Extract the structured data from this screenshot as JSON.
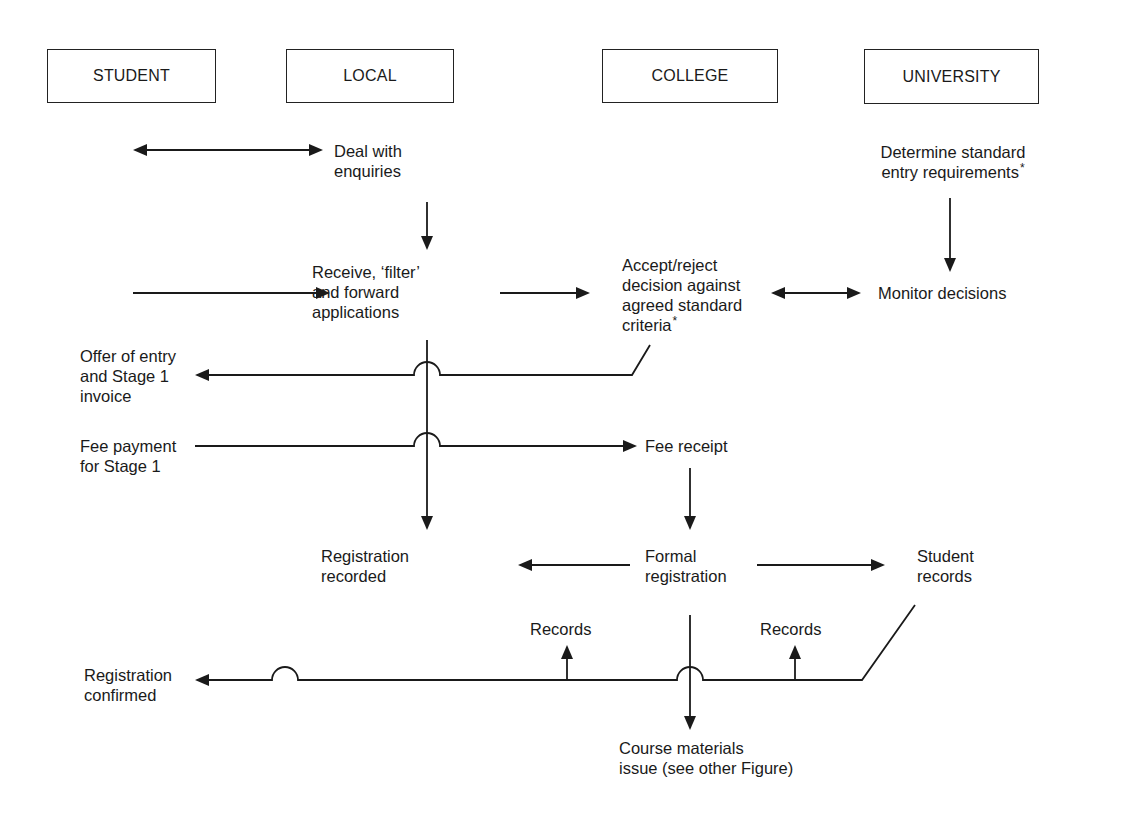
{
  "columns": {
    "student": "STUDENT",
    "local": "LOCAL",
    "college": "COLLEGE",
    "university": "UNIVERSITY"
  },
  "nodes": {
    "deal_enquiries": [
      "Deal with",
      "enquiries"
    ],
    "determine_requirements": [
      "Determine standard",
      "entry requirements"
    ],
    "determine_requirements_mark": "*",
    "receive_filter": [
      "Receive, ‘filter’",
      "and forward",
      "applications"
    ],
    "accept_reject": [
      "Accept/reject",
      "decision against",
      "agreed standard",
      "criteria"
    ],
    "accept_reject_mark": "*",
    "monitor_decisions": "Monitor decisions",
    "offer_entry": [
      "Offer of entry",
      "and Stage 1",
      "invoice"
    ],
    "fee_payment": [
      "Fee payment",
      "for Stage 1"
    ],
    "fee_receipt": "Fee receipt",
    "registration_recorded": [
      "Registration",
      "recorded"
    ],
    "formal_registration": [
      "Formal",
      "registration"
    ],
    "student_records": [
      "Student",
      "records"
    ],
    "records_left": "Records",
    "records_right": "Records",
    "registration_confirmed": [
      "Registration",
      "confirmed"
    ],
    "course_materials": [
      "Course materials",
      "issue (see other Figure)"
    ]
  },
  "edges": [
    {
      "from": "student",
      "to": "deal_enquiries",
      "type": "bidirectional"
    },
    {
      "from": "deal_enquiries",
      "to": "receive_filter",
      "type": "arrow"
    },
    {
      "from": "student",
      "to": "receive_filter",
      "type": "arrow"
    },
    {
      "from": "receive_filter",
      "to": "accept_reject",
      "type": "arrow"
    },
    {
      "from": "accept_reject",
      "to": "monitor_decisions",
      "type": "bidirectional"
    },
    {
      "from": "determine_requirements",
      "to": "monitor_decisions",
      "type": "arrow"
    },
    {
      "from": "accept_reject",
      "to": "offer_entry",
      "type": "arrow"
    },
    {
      "from": "fee_payment",
      "to": "fee_receipt",
      "type": "arrow"
    },
    {
      "from": "receive_filter",
      "to": "registration_recorded",
      "type": "arrow"
    },
    {
      "from": "fee_receipt",
      "to": "formal_registration",
      "type": "arrow"
    },
    {
      "from": "formal_registration",
      "to": "registration_recorded",
      "type": "arrow"
    },
    {
      "from": "formal_registration",
      "to": "student_records",
      "type": "arrow"
    },
    {
      "from": "student_records",
      "to": "registration_confirmed",
      "type": "arrow"
    },
    {
      "from": "student_records",
      "to": "records_left",
      "type": "arrow"
    },
    {
      "from": "student_records",
      "to": "records_right",
      "type": "arrow"
    },
    {
      "from": "formal_registration",
      "to": "course_materials",
      "type": "arrow"
    }
  ],
  "colors": {
    "line": "#1a1a1a",
    "background": "#ffffff"
  }
}
